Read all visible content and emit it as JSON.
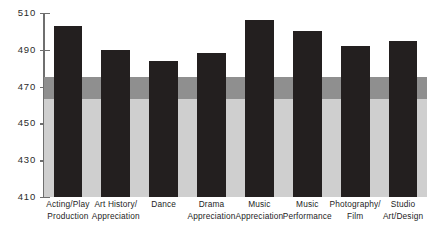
{
  "chart_data": {
    "type": "bar",
    "title": "",
    "subtitle": "",
    "xlabel": "",
    "ylabel": "",
    "ylim": [
      410,
      510
    ],
    "yticks": [
      410,
      430,
      450,
      470,
      490,
      510
    ],
    "grid": false,
    "legend": "none",
    "categories": [
      "Acting/Play Production",
      "Art History/ Appreciation",
      "Dance",
      "Drama Appreciation",
      "Music Appreciation",
      "Music Performance",
      "Photography/ Film",
      "Studio Art/Design"
    ],
    "category_lines": [
      [
        "Acting/Play",
        "Production"
      ],
      [
        "Art History/",
        "Appreciation"
      ],
      [
        "Dance",
        ""
      ],
      [
        "Drama",
        "Appreciation"
      ],
      [
        "Music",
        "Appreciation"
      ],
      [
        "Music",
        "Performance"
      ],
      [
        "Photography/",
        "Film"
      ],
      [
        "Studio",
        "Art/Design"
      ]
    ],
    "values": [
      503,
      490,
      484,
      488,
      506,
      500,
      492,
      495
    ],
    "bands": [
      {
        "name": "lower-band",
        "from": 410,
        "to": 463,
        "color": "#cfcfcf"
      },
      {
        "name": "middle-band",
        "from": 463,
        "to": 475,
        "color": "#8f8f8f"
      }
    ],
    "bar_color": "#231f1f",
    "axis_color": "#6f6f6f"
  }
}
